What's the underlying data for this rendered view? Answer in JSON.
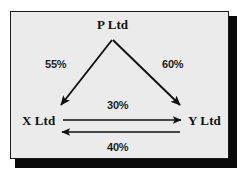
{
  "diagram": {
    "type": "shareholding-structure-diagram",
    "background_color": "#ebebeb",
    "border_color": "#1a1a1a",
    "line_color": "#111111",
    "nodes": [
      {
        "id": "p",
        "label": "P Ltd",
        "position": "top-center"
      },
      {
        "id": "x",
        "label": "X Ltd",
        "position": "bottom-left"
      },
      {
        "id": "y",
        "label": "Y Ltd",
        "position": "bottom-right"
      }
    ],
    "edges": [
      {
        "id": "p-to-x",
        "from": "P Ltd",
        "to": "X Ltd",
        "label": "55%",
        "direction": "down-left"
      },
      {
        "id": "p-to-y",
        "from": "P Ltd",
        "to": "Y Ltd",
        "label": "60%",
        "direction": "down-right"
      },
      {
        "id": "x-to-y",
        "from": "X Ltd",
        "to": "Y Ltd",
        "label": "30%",
        "direction": "right"
      },
      {
        "id": "y-to-x",
        "from": "Y Ltd",
        "to": "X Ltd",
        "label": "40%",
        "direction": "left"
      }
    ]
  }
}
